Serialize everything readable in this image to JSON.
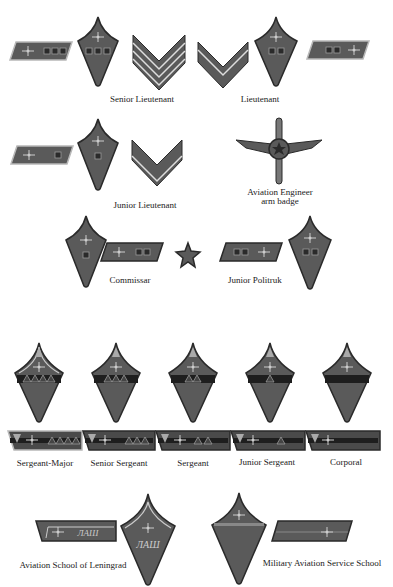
{
  "colors": {
    "background": "#ffffff",
    "insignia_fill": "#5a5a5a",
    "insignia_dark": "#2a2a2a",
    "piping": "#b8b8b8",
    "text": "#222222"
  },
  "sections": {
    "officers": {
      "captions": [
        "Senior Lieutenant",
        "Lieutenant",
        "Junior Lieutenant",
        "Aviation Engineer",
        "arm badge",
        "Commissar",
        "Junior Politruk"
      ]
    },
    "nco": {
      "captions": [
        "Sergeant-Major",
        "Senior Sergeant",
        "Sergeant",
        "Junior Sergeant",
        "Corporal"
      ]
    },
    "schools": {
      "captions": [
        "Aviation School of Leningrad",
        "Military Aviation Service School"
      ],
      "school_marking": "ЛАШ"
    }
  },
  "icons": {
    "wing_propeller": "winged-propeller-emblem",
    "star": "red-star",
    "chevron": "rank-chevron",
    "triangle": "nco-triangle",
    "square": "rank-square"
  }
}
